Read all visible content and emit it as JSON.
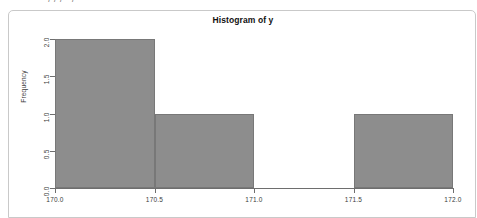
{
  "clipped_text": "—— — — / / / · / · —",
  "chart_data": {
    "type": "bar",
    "title": "Histogram of y",
    "xlabel": "",
    "ylabel": "Frequency",
    "grid": false,
    "legend": "none",
    "xlim": [
      170.0,
      172.0
    ],
    "ylim": [
      0,
      2
    ],
    "xticks": [
      "170.0",
      "170.5",
      "171.0",
      "171.5",
      "172.0"
    ],
    "xtick_values": [
      170.0,
      170.5,
      171.0,
      171.5,
      172.0
    ],
    "yticks": [
      "0.0",
      "0.5",
      "1.0",
      "1.5",
      "2.0"
    ],
    "ytick_values": [
      0.0,
      0.5,
      1.0,
      1.5,
      2.0
    ],
    "bin_edges": [
      170.0,
      170.5,
      171.0,
      171.5,
      172.0
    ],
    "categories": [
      "170.0-170.5",
      "170.5-171.0",
      "171.0-171.5",
      "171.5-172.0"
    ],
    "values": [
      2,
      1,
      0,
      1
    ],
    "bar_color": "#8d8d8d",
    "bar_border_color": "#787878",
    "axis_color": "#6e6e6e",
    "background": "#ffffff"
  }
}
